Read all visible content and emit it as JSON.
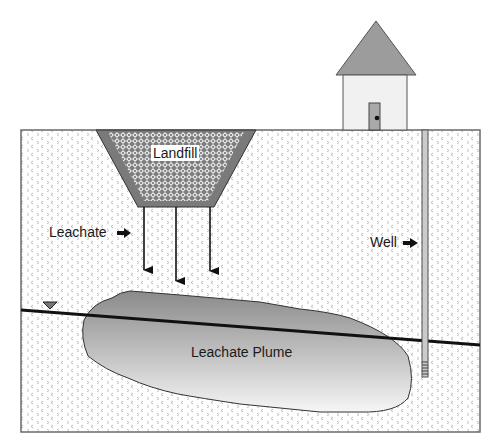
{
  "diagram": {
    "title": "",
    "labels": {
      "landfill": "Landfill",
      "leachate": "Leachate",
      "well": "Well",
      "plume": "Leachate Plume"
    },
    "colors": {
      "ground_fill": "#ffffff",
      "ground_pattern": "#b5b5b5",
      "outline": "#555555",
      "landfill_liner": "#7a7a7a",
      "landfill_fill": "#8c8c8c",
      "roof": "#9a9a9a",
      "house_wall": "#f0f0f0",
      "door": "#a8a8a8",
      "plume_top": "#8f8f8f",
      "plume_bottom": "#f4f4f4",
      "water_table": "#111111",
      "well_casing": "#c8c8c8"
    },
    "elements": [
      "house",
      "ground-surface",
      "landfill",
      "leachate-arrows",
      "well",
      "water-table",
      "leachate-plume"
    ]
  }
}
